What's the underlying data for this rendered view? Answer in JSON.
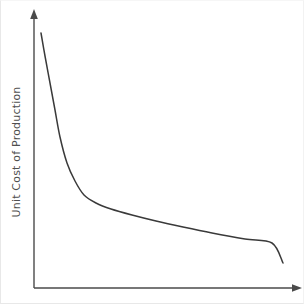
{
  "figure": {
    "width": 304,
    "height": 304,
    "background_color": "#ffffff",
    "frame_color": "#e8e8e8"
  },
  "chart_data": {
    "type": "line",
    "title": "",
    "subtitle": "",
    "xlabel": "",
    "ylabel": "Unit Cost of Production",
    "legend": [],
    "legend_position": "none",
    "grid": false,
    "xticks": [],
    "yticks": [],
    "xticklabels": [],
    "yticklabels": [],
    "xlim": [
      0,
      100
    ],
    "ylim": [
      0,
      100
    ],
    "axis_style": "arrow-headed open axes (L-shaped spines only)",
    "axis_color": "#4a4a4a",
    "annotations": [],
    "series": [
      {
        "name": "Unit cost curve",
        "color": "#3a3a3a",
        "linewidth": 1.5,
        "shape": "monotonically decreasing convex decay (experience / economies-of-scale curve)",
        "x": [
          2.6,
          4.0,
          5.6,
          7.2,
          9.0,
          11.5,
          14.5,
          18.0,
          22.5,
          28.0,
          36.0,
          45.0,
          55.0,
          66.0,
          78.0,
          88.0,
          94.0
        ],
        "y": [
          92.4,
          84.0,
          74.0,
          64.0,
          54.0,
          44.5,
          38.0,
          33.0,
          30.0,
          28.0,
          25.8,
          23.8,
          21.8,
          19.8,
          17.8,
          16.4,
          15.6
        ],
        "pixel_points": [
          [
            41,
            33
          ],
          [
            45,
            56
          ],
          [
            50,
            83
          ],
          [
            55,
            110
          ],
          [
            60,
            137
          ],
          [
            67,
            163
          ],
          [
            75,
            181
          ],
          [
            84,
            195
          ],
          [
            96,
            203
          ],
          [
            111,
            209
          ],
          [
            132,
            215
          ],
          [
            156,
            221
          ],
          [
            183,
            227
          ],
          [
            212,
            233
          ],
          [
            245,
            239
          ],
          [
            272,
            243
          ],
          [
            283,
            263
          ]
        ]
      }
    ]
  },
  "axes": {
    "y_axis": {
      "name": "vertical-axis",
      "x_px": 34,
      "top_px": 12,
      "bottom_px": 288,
      "has_arrow": true,
      "arrow_direction": "up"
    },
    "x_axis": {
      "name": "horizontal-axis",
      "y_px": 288,
      "left_px": 34,
      "right_px": 300,
      "has_arrow": true,
      "arrow_direction": "right"
    }
  },
  "labels": {
    "y_axis_label": "Unit Cost of Production",
    "x_axis_label": ""
  }
}
